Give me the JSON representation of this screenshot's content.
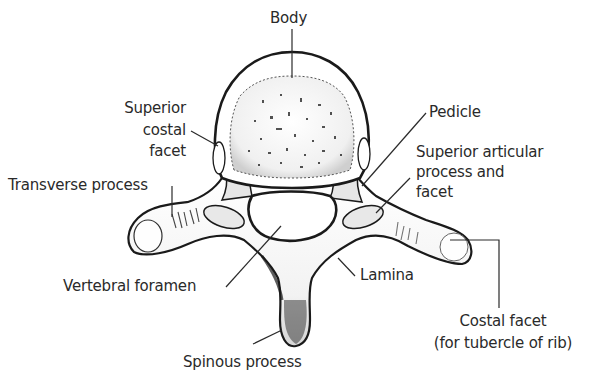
{
  "diagram": {
    "labels": {
      "body": "Body",
      "superior_costal_facet_1": "Superior",
      "superior_costal_facet_2": "costal",
      "superior_costal_facet_3": "facet",
      "pedicle": "Pedicle",
      "superior_articular_1": "Superior articular",
      "superior_articular_2": "process and",
      "superior_articular_3": "facet",
      "transverse_process": "Transverse process",
      "vertebral_foramen": "Vertebral foramen",
      "lamina": "Lamina",
      "costal_facet_1": "Costal facet",
      "costal_facet_2": "(for tubercle of rib)",
      "spinous_process": "Spinous process"
    },
    "colors": {
      "ink": "#1a1a1a",
      "text": "#2a2a2a",
      "shade": "#d9d9d9",
      "background": "#ffffff"
    }
  }
}
